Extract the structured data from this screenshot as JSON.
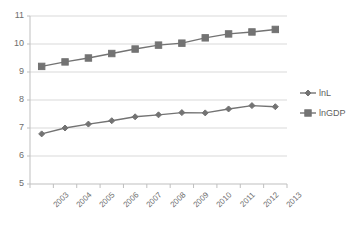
{
  "chart_data": {
    "type": "line",
    "title": "",
    "subtitle": "",
    "xlabel": "",
    "ylabel": "",
    "categories": [
      "2003",
      "2004",
      "2005",
      "2006",
      "2007",
      "2008",
      "2009",
      "2010",
      "2011",
      "2012",
      "2013"
    ],
    "series": [
      {
        "name": "lnL",
        "marker": "diamond",
        "color": "#737373",
        "values": [
          6.79,
          7.0,
          7.14,
          7.26,
          7.4,
          7.47,
          7.55,
          7.54,
          7.68,
          7.8,
          7.76
        ]
      },
      {
        "name": "lnGDP",
        "marker": "square",
        "color": "#737373",
        "values": [
          9.2,
          9.36,
          9.5,
          9.66,
          9.82,
          9.96,
          10.03,
          10.22,
          10.36,
          10.43,
          10.52
        ]
      }
    ],
    "ylim": [
      5,
      11
    ],
    "ytick_step": 1,
    "yticks": [
      "11",
      "10",
      "9",
      "8",
      "7",
      "6",
      "5"
    ],
    "grid": true,
    "grid_axis": "y",
    "legend_position": "right",
    "xtick_rotation": -45,
    "colors": {
      "series_line": "#737373",
      "gridline": "#d9d9d9",
      "axis": "#bfbfbf",
      "tick_text": "#6e6e6e",
      "legend_text": "#5f5f5f",
      "background": "#ffffff"
    }
  }
}
